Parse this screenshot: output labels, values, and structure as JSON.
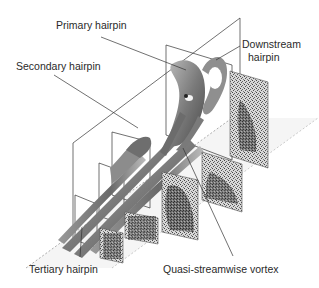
{
  "figure": {
    "labels": {
      "primary": "Primary hairpin",
      "secondary": "Secondary hairpin",
      "downstream_line1": "Downstream",
      "downstream_line2": "hairpin",
      "tertiary": "Tertiary hairpin",
      "quasi": "Quasi-streamwise vortex"
    },
    "colors": {
      "line": "#333333",
      "vortex_dark": "#5a5a5a",
      "vortex_mid": "#8a8a8a",
      "vortex_light": "#bdbdbd",
      "panel_texture": "#3a3a3a",
      "floor": "#f2f2f2"
    }
  }
}
